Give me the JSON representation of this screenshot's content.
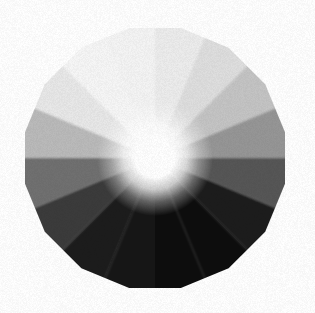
{
  "figure": {
    "type": "radial-sector-wheel",
    "background_color": "#ffffff",
    "canvas": {
      "width": 315,
      "height": 313
    },
    "center": {
      "x": 155,
      "y": 158
    },
    "outer_radius": 130,
    "polygon_sides": 16,
    "polygon_rotation_deg": -90,
    "hub": {
      "name": "center-highlight-hub",
      "color": "#ffffff",
      "radius": 26,
      "glow_radius": 58,
      "description": "bright white specular hub at the center of the wheel"
    },
    "sector_count": 16,
    "sector_arc_deg": 22.5,
    "start_angle_deg": -90,
    "edge_softness": "slight blur / scan noise along sector boundaries"
  },
  "chart_data": {
    "type": "pie",
    "subtitle": "16 equal sectors, luminance ramp from near-white to near-black",
    "xlabel": "",
    "ylabel": "",
    "legend_position": "none",
    "grid": false,
    "equal_slices": true,
    "slice_value": 22.5,
    "value_unit": "degrees",
    "categories": [
      "S1",
      "S2",
      "S3",
      "S4",
      "S5",
      "S6",
      "S7",
      "S8",
      "S9",
      "S10",
      "S11",
      "S12",
      "S13",
      "S14",
      "S15",
      "S16"
    ],
    "values": [
      22.5,
      22.5,
      22.5,
      22.5,
      22.5,
      22.5,
      22.5,
      22.5,
      22.5,
      22.5,
      22.5,
      22.5,
      22.5,
      22.5,
      22.5,
      22.5
    ],
    "series": [
      {
        "name": "Sector luminance (0-255)",
        "values": [
          236,
          222,
          196,
          150,
          86,
          30,
          14,
          12,
          18,
          26,
          58,
          112,
          186,
          232,
          246,
          244
        ]
      }
    ],
    "sectors": [
      {
        "index": 1,
        "label": "S1",
        "start_deg": -90.0,
        "end_deg": -67.5,
        "luminance": 236,
        "color": "#ececec",
        "position": "top"
      },
      {
        "index": 2,
        "label": "S2",
        "start_deg": -67.5,
        "end_deg": -45.0,
        "luminance": 222,
        "color": "#dedede",
        "position": "top-right"
      },
      {
        "index": 3,
        "label": "S3",
        "start_deg": -45.0,
        "end_deg": -22.5,
        "luminance": 196,
        "color": "#c4c4c4",
        "position": "upper-right"
      },
      {
        "index": 4,
        "label": "S4",
        "start_deg": -22.5,
        "end_deg": 0.0,
        "luminance": 150,
        "color": "#969696",
        "position": "right-upper"
      },
      {
        "index": 5,
        "label": "S5",
        "start_deg": 0.0,
        "end_deg": 22.5,
        "luminance": 86,
        "color": "#565656",
        "position": "right"
      },
      {
        "index": 6,
        "label": "S6",
        "start_deg": 22.5,
        "end_deg": 45.0,
        "luminance": 30,
        "color": "#1e1e1e",
        "position": "right-lower"
      },
      {
        "index": 7,
        "label": "S7",
        "start_deg": 45.0,
        "end_deg": 67.5,
        "luminance": 14,
        "color": "#0e0e0e",
        "position": "lower-right"
      },
      {
        "index": 8,
        "label": "S8",
        "start_deg": 67.5,
        "end_deg": 90.0,
        "luminance": 12,
        "color": "#0c0c0c",
        "position": "bottom-right"
      },
      {
        "index": 9,
        "label": "S9",
        "start_deg": 90.0,
        "end_deg": 112.5,
        "luminance": 18,
        "color": "#121212",
        "position": "bottom"
      },
      {
        "index": 10,
        "label": "S10",
        "start_deg": 112.5,
        "end_deg": 135.0,
        "luminance": 26,
        "color": "#1a1a1a",
        "position": "bottom-left-inner"
      },
      {
        "index": 11,
        "label": "S11",
        "start_deg": 135.0,
        "end_deg": 157.5,
        "luminance": 58,
        "color": "#3a3a3a",
        "position": "bottom-left"
      },
      {
        "index": 12,
        "label": "S12",
        "start_deg": 157.5,
        "end_deg": 180.0,
        "luminance": 112,
        "color": "#707070",
        "position": "lower-left"
      },
      {
        "index": 13,
        "label": "S13",
        "start_deg": 180.0,
        "end_deg": 202.5,
        "luminance": 186,
        "color": "#bababa",
        "position": "left-lower"
      },
      {
        "index": 14,
        "label": "S14",
        "start_deg": 202.5,
        "end_deg": 225.0,
        "luminance": 232,
        "color": "#e8e8e8",
        "position": "left"
      },
      {
        "index": 15,
        "label": "S15",
        "start_deg": 225.0,
        "end_deg": 247.5,
        "luminance": 246,
        "color": "#f6f6f6",
        "position": "upper-left"
      },
      {
        "index": 16,
        "label": "S16",
        "start_deg": 247.5,
        "end_deg": 270.0,
        "luminance": 244,
        "color": "#f4f4f4",
        "position": "top-left"
      }
    ]
  }
}
